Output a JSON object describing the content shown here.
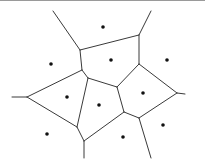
{
  "diagram": {
    "type": "voronoi",
    "colors": {
      "edge": "#3a3a3a",
      "site": "#111111",
      "background": "#ffffff",
      "border": "#9a9a9a"
    },
    "sites": [
      {
        "x": 103,
        "y": 27
      },
      {
        "x": 51,
        "y": 64
      },
      {
        "x": 111,
        "y": 60
      },
      {
        "x": 167,
        "y": 60
      },
      {
        "x": 67,
        "y": 97
      },
      {
        "x": 99,
        "y": 105
      },
      {
        "x": 143,
        "y": 93
      },
      {
        "x": 163,
        "y": 125
      },
      {
        "x": 47,
        "y": 134
      },
      {
        "x": 123,
        "y": 137
      }
    ],
    "edges": [
      {
        "x1": 53,
        "y1": 11,
        "x2": 80,
        "y2": 50
      },
      {
        "x1": 80,
        "y1": 50,
        "x2": 139,
        "y2": 35
      },
      {
        "x1": 139,
        "y1": 35,
        "x2": 151,
        "y2": 11
      },
      {
        "x1": 80,
        "y1": 50,
        "x2": 82,
        "y2": 70
      },
      {
        "x1": 139,
        "y1": 35,
        "x2": 139,
        "y2": 64
      },
      {
        "x1": 82,
        "y1": 70,
        "x2": 88,
        "y2": 78
      },
      {
        "x1": 88,
        "y1": 78,
        "x2": 117,
        "y2": 87
      },
      {
        "x1": 117,
        "y1": 87,
        "x2": 139,
        "y2": 64
      },
      {
        "x1": 139,
        "y1": 64,
        "x2": 177,
        "y2": 93
      },
      {
        "x1": 177,
        "y1": 93,
        "x2": 185,
        "y2": 94
      },
      {
        "x1": 82,
        "y1": 70,
        "x2": 27,
        "y2": 97
      },
      {
        "x1": 27,
        "y1": 97,
        "x2": 12,
        "y2": 97
      },
      {
        "x1": 27,
        "y1": 97,
        "x2": 77,
        "y2": 127
      },
      {
        "x1": 88,
        "y1": 78,
        "x2": 77,
        "y2": 127
      },
      {
        "x1": 117,
        "y1": 87,
        "x2": 124,
        "y2": 112
      },
      {
        "x1": 124,
        "y1": 112,
        "x2": 139,
        "y2": 118
      },
      {
        "x1": 139,
        "y1": 118,
        "x2": 177,
        "y2": 93
      },
      {
        "x1": 124,
        "y1": 112,
        "x2": 84,
        "y2": 141
      },
      {
        "x1": 77,
        "y1": 127,
        "x2": 84,
        "y2": 141
      },
      {
        "x1": 84,
        "y1": 141,
        "x2": 84,
        "y2": 158
      },
      {
        "x1": 139,
        "y1": 118,
        "x2": 151,
        "y2": 158
      }
    ]
  }
}
